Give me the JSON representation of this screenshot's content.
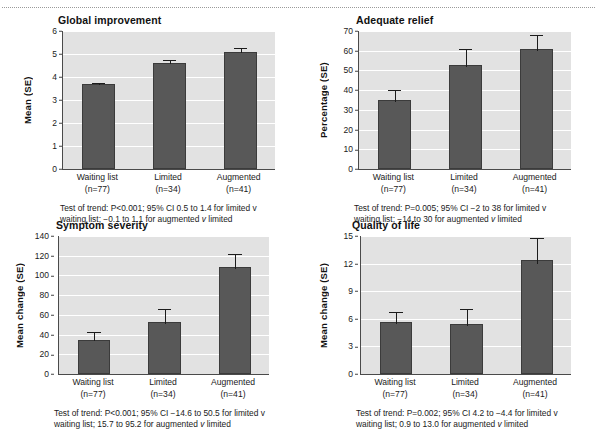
{
  "figure": {
    "panel_count": 4,
    "bar_color": "#585858",
    "plot_background": "#e2e2e2",
    "gridline_color": "#ffffff",
    "axis_color": "#4a4a4a"
  },
  "groups": [
    {
      "name": "Waiting list",
      "n_label": "(n=77)"
    },
    {
      "name": "Limited",
      "n_label": "(n=34)"
    },
    {
      "name": "Augmented",
      "n_label": "(n=41)"
    }
  ],
  "chart_data": [
    {
      "type": "bar",
      "title": "Global improvement",
      "xlabel": "",
      "ylabel": "Mean (SE)",
      "categories": [
        "Waiting list",
        "Limited",
        "Augmented"
      ],
      "category_sublabels": [
        "(n=77)",
        "(n=34)",
        "(n=41)"
      ],
      "values": [
        3.68,
        4.6,
        5.08
      ],
      "errors": [
        0.08,
        0.12,
        0.2
      ],
      "ylim": [
        0,
        6
      ],
      "yticks": [
        0,
        1,
        2,
        3,
        4,
        5,
        6
      ],
      "grid": true,
      "legend": "none",
      "caption_line1": "Test of trend: P<0.001; 95% CI 0.5 to 1.4 for limited v",
      "caption_line2": "waiting list; −0.1 to 1.1 for augmented v limited"
    },
    {
      "type": "bar",
      "title": "Adequate relief",
      "xlabel": "",
      "ylabel": "Percentage (SE)",
      "categories": [
        "Waiting list",
        "Limited",
        "Augmented"
      ],
      "category_sublabels": [
        "(n=77)",
        "(n=34)",
        "(n=41)"
      ],
      "values": [
        35,
        53,
        61
      ],
      "errors": [
        5,
        8,
        7
      ],
      "ylim": [
        0,
        70
      ],
      "yticks": [
        0,
        10,
        20,
        30,
        40,
        50,
        60,
        70
      ],
      "grid": true,
      "legend": "none",
      "caption_line1": "Test of trend: P=0.005; 95% CI −2 to 38 for limited v",
      "caption_line2": "waiting list; −14 to 30 for augmented v limited"
    },
    {
      "type": "bar",
      "title": "Symptom severity",
      "xlabel": "",
      "ylabel": "Mean change (SE)",
      "categories": [
        "Waiting list",
        "Limited",
        "Augmented"
      ],
      "category_sublabels": [
        "(n=77)",
        "(n=34)",
        "(n=41)"
      ],
      "values": [
        35,
        53,
        109
      ],
      "errors": [
        8,
        13,
        13
      ],
      "ylim": [
        0,
        140
      ],
      "yticks": [
        0,
        20,
        40,
        60,
        80,
        100,
        120,
        140
      ],
      "grid": true,
      "legend": "none",
      "caption_line1": "Test of trend: P<0.001; 95% CI −14.6 to 50.5 for limited v",
      "caption_line2": "waiting list; 15.7 to 95.2 for augmented v limited"
    },
    {
      "type": "bar",
      "title": "Quality of life",
      "xlabel": "",
      "ylabel": "Mean change (SE)",
      "categories": [
        "Waiting list",
        "Limited",
        "Augmented"
      ],
      "category_sublabels": [
        "(n=77)",
        "(n=34)",
        "(n=41)"
      ],
      "values": [
        5.6,
        5.45,
        12.4
      ],
      "errors": [
        1.15,
        1.6,
        2.4
      ],
      "ylim": [
        0,
        15
      ],
      "yticks": [
        0,
        3,
        6,
        9,
        12,
        15
      ],
      "grid": true,
      "legend": "none",
      "caption_line1": "Test of trend: P=0.002; 95% CI 4.2 to −4.4 for limited v",
      "caption_line2": "waiting list; 0.9 to 13.0 for augmented v limited"
    }
  ]
}
